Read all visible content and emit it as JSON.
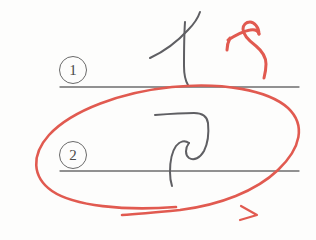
{
  "page": {
    "background_color": "#fdfdfc",
    "width": 316,
    "height": 240
  },
  "markers": [
    {
      "id": "marker-1",
      "label": "1",
      "shape": "circled-number",
      "x": 59,
      "y": 56
    },
    {
      "id": "marker-2",
      "label": "2",
      "shape": "circled-number",
      "x": 59,
      "y": 141
    }
  ],
  "rules": {
    "color": "#6e6e6e",
    "lines": [
      {
        "name": "baseline-row-1",
        "x1": 60,
        "y1": 87,
        "x2": 299,
        "y2": 87
      },
      {
        "name": "baseline-row-2",
        "x1": 60,
        "y1": 171,
        "x2": 299,
        "y2": 171
      }
    ]
  },
  "strokes": {
    "pencil_color": "#5f5f63",
    "ink_color": "#e15a50",
    "glyphs": [
      {
        "name": "katakana-i-pencil",
        "character": "イ",
        "color": "#5f5f63",
        "row": 1,
        "description": "pencil-written katakana I above baseline 1"
      },
      {
        "name": "katakana-ka-red",
        "character": "カ",
        "color": "#e15a50",
        "row": 1,
        "description": "red-ink written katakana KA above baseline 1"
      },
      {
        "name": "katakana-ka-pencil",
        "character": "カ",
        "color": "#5f5f63",
        "row": 2,
        "description": "pencil-written katakana KA sitting on baseline 2"
      }
    ]
  },
  "annotation": {
    "name": "red-ellipse-loop",
    "color": "#e15a50",
    "shape": "ellipse-with-arrow",
    "target_row": 2,
    "has_arrowhead": true,
    "description": "large red loop encircling row 2, ending in an arrowhead pointing right"
  }
}
